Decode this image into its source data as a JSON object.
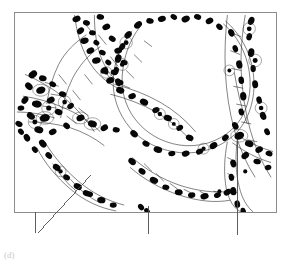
{
  "figure": {
    "panel_label": "(d)",
    "frame": {
      "x": 14,
      "y": 12,
      "width": 263,
      "height": 201,
      "border_color": "#8c8c8c",
      "background": "#ffffff"
    },
    "palette": {
      "ink": "#000000",
      "nucleus_fill": "#0a0a0a",
      "cytoplasm_outline": "#1a1a1a",
      "septum_outline": "#222222",
      "airspace": "#ffffff",
      "frame_border": "#8c8c8c",
      "leader_line": "#4d4d4d",
      "label_text": "#c9c9c9"
    },
    "specimen": {
      "subject": "lung-alveolar-tissue",
      "rendering": "line-drawing-halftone",
      "airspaces": [
        {
          "name": "large-central-alveolus",
          "cx": 178,
          "cy": 80,
          "rx": 63,
          "ry": 60
        },
        {
          "name": "lower-left-alveolus",
          "cx": 78,
          "cy": 165,
          "rx": 58,
          "ry": 45
        },
        {
          "name": "upper-left-airspace",
          "cx": 46,
          "cy": 36,
          "rx": 26,
          "ry": 22
        },
        {
          "name": "right-lower-airspace",
          "cx": 250,
          "cy": 172,
          "rx": 30,
          "ry": 33
        },
        {
          "name": "lower-mid-airspace",
          "cx": 152,
          "cy": 188,
          "rx": 36,
          "ry": 22
        }
      ],
      "septa": [
        {
          "name": "upper-left-septum"
        },
        {
          "name": "central-branch-node"
        },
        {
          "name": "right-vertical-septum"
        },
        {
          "name": "lower-arch-septum"
        },
        {
          "name": "left-thick-septum"
        }
      ]
    },
    "leader_lines": [
      {
        "name": "leader-line-left-diagonal",
        "x1": 91,
        "y1": 175,
        "x2": 38,
        "y2": 233,
        "target": "alveolar-septum-left"
      },
      {
        "name": "leader-line-left-vertical",
        "x1": 35,
        "y1": 212,
        "x2": 35,
        "y2": 233,
        "target": "alveolar-wall-left"
      },
      {
        "name": "leader-line-center-vertical",
        "x1": 148,
        "y1": 206,
        "x2": 148,
        "y2": 234,
        "target": "alveolar-duct-center"
      },
      {
        "name": "leader-line-right-vertical",
        "x1": 237,
        "y1": 141,
        "x2": 237,
        "y2": 235,
        "target": "interalveolar-septum-right"
      }
    ]
  }
}
